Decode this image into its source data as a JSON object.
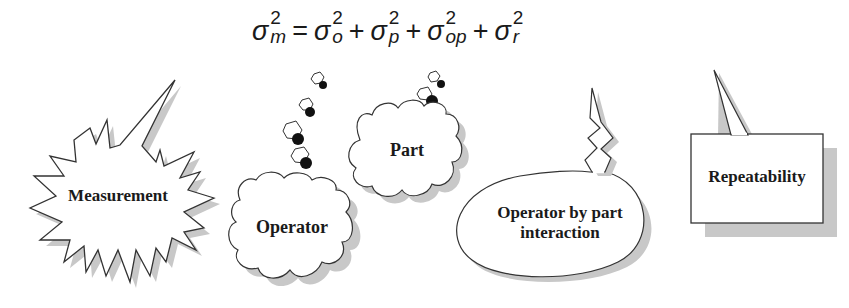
{
  "equation": {
    "lhs": {
      "symbol": "σ",
      "sup": "2",
      "sub": "m"
    },
    "equals": "=",
    "terms": [
      {
        "symbol": "σ",
        "sup": "2",
        "sub": "o"
      },
      {
        "symbol": "σ",
        "sup": "2",
        "sub": "p"
      },
      {
        "symbol": "σ",
        "sup": "2",
        "sub": "op"
      },
      {
        "symbol": "σ",
        "sup": "2",
        "sub": "r"
      }
    ],
    "plus": "+"
  },
  "bubbles": [
    {
      "id": "measurement",
      "label": "Measurement",
      "shape": "explosion"
    },
    {
      "id": "operator",
      "label": "Operator",
      "shape": "thought-cloud"
    },
    {
      "id": "part",
      "label": "Part",
      "shape": "thought-cloud"
    },
    {
      "id": "interaction",
      "label_line1": "Operator by part",
      "label_line2": "interaction",
      "shape": "oval-callout"
    },
    {
      "id": "repeatability",
      "label": "Repeatability",
      "shape": "rectangle-callout"
    }
  ],
  "colors": {
    "outline": "#333333",
    "shadow": "#bdbdbd",
    "fill": "#ffffff",
    "text": "#1a1a1a"
  }
}
